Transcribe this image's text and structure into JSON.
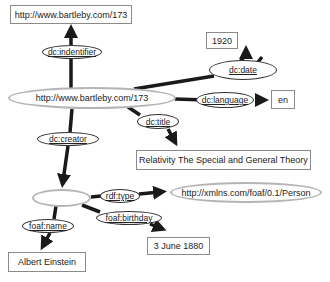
{
  "diagram": {
    "type": "RDF graph",
    "nodes": {
      "subject_uri": "http://www.bartleby.com/173",
      "identifier_value": "http://www.bartleby.com/173",
      "date_value": "1920",
      "language_value": "en",
      "title_value": "Relativity The Special and General Theory",
      "creator_blank": "",
      "person_type": "http://xmlns.com/foaf/0.1/Person",
      "birthday_value": "3 June 1880",
      "name_value": "Albert Einstein"
    },
    "properties": {
      "identifier": "dc:indentifier",
      "date": "dc:date",
      "language": "dc:language",
      "title": "dc:title",
      "creator": "dc:creator",
      "type": "rdf:type",
      "birthday": "foaf:birthday",
      "name": "foaf:name"
    },
    "edges": [
      {
        "from": "http://www.bartleby.com/173",
        "property": "dc:indentifier",
        "to": "http://www.bartleby.com/173"
      },
      {
        "from": "http://www.bartleby.com/173",
        "property": "dc:date",
        "to": "1920"
      },
      {
        "from": "http://www.bartleby.com/173",
        "property": "dc:language",
        "to": "en"
      },
      {
        "from": "http://www.bartleby.com/173",
        "property": "dc:title",
        "to": "Relativity The Special and General Theory"
      },
      {
        "from": "http://www.bartleby.com/173",
        "property": "dc:creator",
        "to": "_:blank"
      },
      {
        "from": "_:blank",
        "property": "rdf:type",
        "to": "http://xmlns.com/foaf/0.1/Person"
      },
      {
        "from": "_:blank",
        "property": "foaf:birthday",
        "to": "3 June 1880"
      },
      {
        "from": "_:blank",
        "property": "foaf:name",
        "to": "Albert Einstein"
      }
    ],
    "colors": {
      "edge": "#1a1a1a",
      "resource_border": "#b5b5b5",
      "literal_border": "#8a8a8a"
    }
  }
}
